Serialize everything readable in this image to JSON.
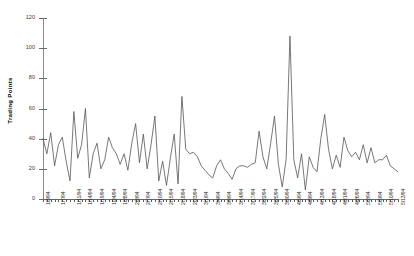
{
  "chart_data": {
    "type": "line",
    "title": "",
    "xlabel": "",
    "ylabel": "Trading Points",
    "ylim": [
      0,
      120
    ],
    "yticks": [
      0,
      20,
      40,
      60,
      80,
      100,
      120
    ],
    "grid": false,
    "legend": null,
    "line_color": "#555555",
    "x": [
      "1/3/94",
      "1/4/94",
      "1/5/94",
      "1/6/94",
      "1/7/94",
      "1/10/94",
      "1/11/94",
      "1/12/94",
      "1/13/94",
      "1/14/94",
      "1/17/94",
      "1/18/94",
      "1/19/94",
      "1/20/94",
      "1/21/94",
      "1/24/94",
      "1/25/94",
      "1/26/94",
      "1/27/94",
      "1/28/94",
      "1/31/94",
      "2/1/94",
      "2/2/94",
      "2/3/94",
      "2/4/94",
      "2/7/94",
      "2/8/94",
      "2/9/94",
      "2/10/94",
      "2/11/94",
      "2/14/94",
      "2/15/94",
      "2/16/94",
      "2/17/94",
      "2/18/94",
      "2/22/94",
      "2/23/94",
      "2/24/94",
      "2/25/94",
      "2/28/94",
      "3/1/94",
      "3/2/94",
      "3/3/94",
      "3/4/94",
      "3/7/94",
      "3/8/94",
      "3/9/94",
      "3/10/94",
      "3/11/94",
      "3/14/94",
      "3/15/94",
      "3/16/94",
      "3/17/94",
      "3/18/94",
      "3/21/94",
      "3/22/94",
      "3/23/94",
      "3/24/94",
      "3/25/94",
      "3/28/94",
      "3/29/94",
      "3/30/94",
      "3/31/94",
      "4/4/94",
      "4/5/94",
      "4/6/94",
      "4/7/94",
      "4/8/94",
      "4/11/94",
      "4/12/94",
      "4/13/94",
      "4/14/94",
      "4/15/94",
      "4/18/94",
      "4/19/94",
      "4/20/94",
      "4/21/94",
      "4/22/94",
      "4/25/94",
      "4/26/94",
      "4/27/94",
      "4/28/94",
      "4/29/94",
      "5/2/94",
      "5/3/94",
      "5/4/94",
      "5/5/94",
      "5/6/94",
      "5/9/94",
      "5/10/94",
      "5/11/94",
      "5/12/94",
      "5/13/94"
    ],
    "xtick_labels": [
      "1/3/94",
      "1/7/94",
      "1/11/94",
      "1/14/94",
      "1/19/94",
      "1/24/94",
      "1/28/94",
      "2/2/94",
      "2/7/94",
      "2/10/94",
      "2/15/94",
      "2/18/94",
      "2/23/94",
      "3/1/94",
      "3/4/94",
      "3/9/94",
      "3/14/94",
      "3/17/94",
      "3/22/94",
      "3/25/94",
      "3/30/94",
      "4/5/94",
      "4/8/94",
      "4/13/94",
      "4/18/94",
      "4/21/94",
      "4/26/94",
      "5/2/94",
      "5/5/94",
      "5/10/94",
      "5/13/94"
    ],
    "xtick_indices": [
      0,
      4,
      8,
      11,
      14,
      17,
      20,
      23,
      26,
      29,
      32,
      35,
      38,
      41,
      44,
      47,
      50,
      53,
      56,
      59,
      62,
      65,
      68,
      71,
      74,
      77,
      80,
      83,
      86,
      89,
      92
    ],
    "values": [
      40,
      30,
      44,
      22,
      36,
      41,
      25,
      12,
      58,
      27,
      36,
      60,
      14,
      30,
      37,
      20,
      26,
      41,
      34,
      30,
      23,
      30,
      19,
      37,
      50,
      24,
      43,
      20,
      36,
      55,
      12,
      25,
      9,
      27,
      43,
      10,
      68,
      33,
      30,
      31,
      28,
      22,
      19,
      16,
      14,
      22,
      26,
      20,
      17,
      13,
      20,
      22,
      22,
      21,
      23,
      24,
      45,
      28,
      20,
      37,
      55,
      23,
      8,
      26,
      108,
      26,
      14,
      30,
      6,
      28,
      21,
      18,
      40,
      56,
      33,
      20,
      29,
      21,
      41,
      32,
      28,
      31,
      26,
      36,
      24,
      34,
      24,
      26,
      26,
      29,
      22,
      20,
      18
    ]
  }
}
